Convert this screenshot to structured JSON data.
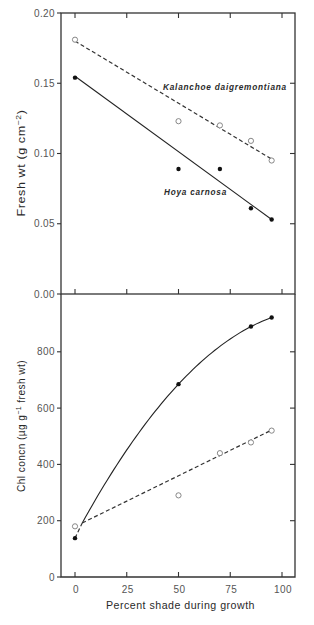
{
  "figure": {
    "x_axis_title": "Percent shade during growth"
  },
  "chart_data": [
    {
      "type": "line",
      "panel": "top",
      "title": "",
      "xlabel": "",
      "ylabel": "Fresh wt (g cm⁻²)",
      "ylabel_parts": [
        "Fresh wt (g cm",
        "−2",
        ")"
      ],
      "xlim": [
        0,
        100
      ],
      "ylim": [
        0,
        0.2
      ],
      "xticks": [
        0,
        25,
        50,
        75,
        100
      ],
      "xtick_labels": [],
      "yticks": [
        0,
        0.05,
        0.1,
        0.15,
        0.2
      ],
      "ytick_labels": [
        "0.00",
        "0.05",
        "0.10",
        "0.15",
        "0.20"
      ],
      "grid": false,
      "legend": "inline labels",
      "series": [
        {
          "name": "Kalanchoe daigremontiana",
          "marker": "open-circle",
          "line_style": "dashed",
          "x": [
            0,
            50,
            70,
            85,
            95
          ],
          "values": [
            0.181,
            0.123,
            0.12,
            0.109,
            0.095
          ],
          "fit": {
            "type": "linear",
            "from": [
              0,
              0.18
            ],
            "to": [
              95,
              0.096
            ]
          }
        },
        {
          "name": "Hoya carnosa",
          "marker": "filled-circle",
          "line_style": "solid",
          "x": [
            0,
            50,
            70,
            85,
            95
          ],
          "values": [
            0.154,
            0.089,
            0.089,
            0.061,
            0.053
          ],
          "fit": {
            "type": "linear",
            "from": [
              0,
              0.155
            ],
            "to": [
              95,
              0.053
            ]
          }
        }
      ],
      "annotations": [
        {
          "text": "Kalanchoe daigremontiana",
          "x": 42.5,
          "y": 0.145
        },
        {
          "text": "Hoya carnosa",
          "x": 43,
          "y": 0.0705
        }
      ]
    },
    {
      "type": "line",
      "panel": "bottom",
      "title": "",
      "xlabel": "Percent shade during growth",
      "ylabel": "Chl concn (µg g⁻¹ fresh wt)",
      "ylabel_parts": [
        "Chl concn (µg g",
        "−1",
        " fresh wt)"
      ],
      "xlim": [
        0,
        100
      ],
      "ylim": [
        0,
        1000
      ],
      "xticks": [
        0,
        25,
        50,
        75,
        100
      ],
      "xtick_labels": [
        "0",
        "25",
        "50",
        "75",
        "100"
      ],
      "yticks": [
        0,
        200,
        400,
        600,
        800
      ],
      "ytick_labels": [
        "0",
        "200",
        "400",
        "600",
        "800"
      ],
      "grid": false,
      "legend": "none",
      "series": [
        {
          "name": "Hoya carnosa",
          "marker": "filled-circle",
          "line_style": "solid",
          "x": [
            0,
            50,
            85,
            95
          ],
          "values": [
            138,
            685,
            890,
            922
          ],
          "fit": {
            "type": "quadratic",
            "coefficients": [
              144.7,
              13.72,
              -0.05831
            ],
            "domain": [
              3.5,
              95
            ],
            "lead_in": {
              "from": [
                0,
                138
              ],
              "to": [
                3.5,
                192
              ]
            }
          }
        },
        {
          "name": "Kalanchoe daigremontiana",
          "marker": "open-circle",
          "line_style": "dashed",
          "x": [
            0,
            50,
            70,
            85,
            95
          ],
          "values": [
            180,
            290,
            440,
            478,
            520
          ],
          "fit": {
            "type": "linear",
            "from": [
              3.5,
              192
            ],
            "to": [
              95,
              522
            ]
          }
        }
      ],
      "annotations": []
    }
  ]
}
